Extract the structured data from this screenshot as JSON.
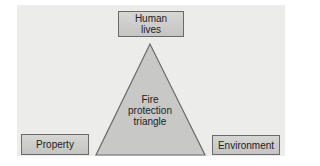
{
  "diagram": {
    "title": "Fire protection triangle",
    "center_label_lines": [
      "Fire",
      "protection",
      "triangle"
    ],
    "nodes": {
      "top": {
        "line1": "Human",
        "line2": "lives"
      },
      "left": "Property",
      "right": "Environment"
    },
    "colors": {
      "panel": "#ececea",
      "box_fill": "#cfcfcd",
      "triangle_fill": "#c8c8c6",
      "outline": "#6a6a6a"
    }
  }
}
